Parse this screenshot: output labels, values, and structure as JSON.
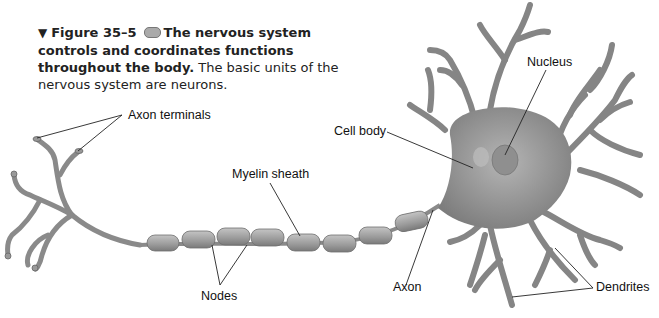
{
  "caption": {
    "triangle_icon": "down-triangle-icon",
    "figure_number": "Figure 35–5",
    "pill_icon": "objective-pill-icon",
    "bold_text": "The nervous system controls and coordinates functions throughout the body.",
    "body_text": "The basic units of the nervous system are neurons.",
    "triangle_glyph": "▼"
  },
  "labels": {
    "axon_terminals": "Axon terminals",
    "nucleus": "Nucleus",
    "cell_body": "Cell body",
    "myelin_sheath": "Myelin sheath",
    "nodes": "Nodes",
    "axon": "Axon",
    "dendrites": "Dendrites"
  },
  "colors": {
    "neuron_fill": "#8c8c8c",
    "neuron_dark": "#6e6e6e",
    "myelin_fill": "#a8a8a8",
    "nucleus_fill": "#9a9a9a",
    "leader_line": "#222222"
  }
}
